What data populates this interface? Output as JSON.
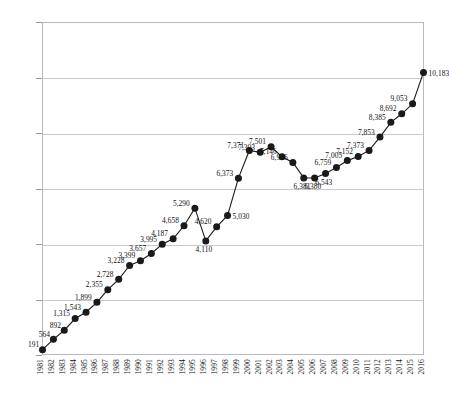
{
  "chart_data": {
    "type": "line",
    "title": "",
    "xlabel": "",
    "ylabel": "",
    "ylim": [
      0,
      12000
    ],
    "y_ticks": [
      "0",
      "2,000",
      "4,000",
      "6,000",
      "8,000",
      "10,000",
      "12,000"
    ],
    "y_tick_values": [
      0,
      2000,
      4000,
      6000,
      8000,
      10000,
      12000
    ],
    "grid": "horizontal",
    "legend": "none",
    "marker": "filled-circle",
    "line_color": "#1a1a1a",
    "marker_color": "#1a1a1a",
    "categories": [
      "1981",
      "1982",
      "1983",
      "1984",
      "1985",
      "1986",
      "1987",
      "1988",
      "1989",
      "1990",
      "1991",
      "1992",
      "1993",
      "1994",
      "1995",
      "1996",
      "1997",
      "1998",
      "1999",
      "2000",
      "2001",
      "2002",
      "2003",
      "2004",
      "2005",
      "2006",
      "2007",
      "2008",
      "2009",
      "2010",
      "2011",
      "2012",
      "2013",
      "2014",
      "2015",
      "2016"
    ],
    "values": [
      191,
      564,
      892,
      1315,
      1543,
      1899,
      2355,
      2728,
      3228,
      3399,
      3657,
      3995,
      4187,
      4658,
      5290,
      4110,
      4620,
      5030,
      6373,
      7371,
      7303,
      7501,
      7146,
      6936,
      6381,
      6380,
      6543,
      6759,
      7005,
      7152,
      7373,
      7853,
      8385,
      8692,
      9053,
      10183
    ],
    "point_labels": [
      "191",
      "564",
      "892",
      "1,315",
      "1,543",
      "1,899",
      "2,355",
      "2,728",
      "3,228",
      "3,399",
      "3,657",
      "3,995",
      "4,187",
      "4,658",
      "5,290",
      "4,110",
      "4,620",
      "5,030",
      "6,373",
      "7,371",
      "7,303",
      "7,501",
      "7,146",
      "6,936",
      "6,381",
      "6,380",
      "6,543",
      "6,759",
      "7,005",
      "7,152",
      "7,373",
      "7,853",
      "8,385",
      "8,692",
      "9,053",
      "10,183"
    ]
  }
}
